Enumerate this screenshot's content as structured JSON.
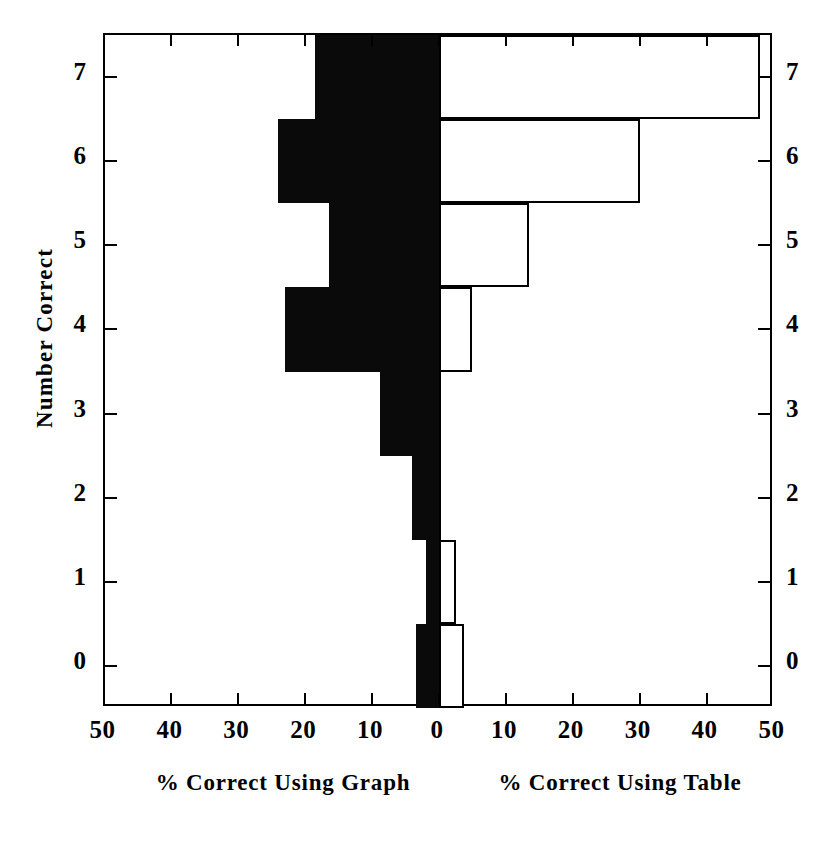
{
  "chart_data": {
    "type": "bar",
    "orientation": "horizontal",
    "subtype": "back-to-back bidirectional histogram",
    "title": "",
    "ylabel": "Number Correct",
    "xlabel": "",
    "categories": [
      "0",
      "1",
      "2",
      "3",
      "4",
      "5",
      "6",
      "7"
    ],
    "y_tick_labels": [
      "0",
      "1",
      "2",
      "3",
      "4",
      "5",
      "6",
      "7"
    ],
    "x_tick_labels_left": [
      "50",
      "40",
      "30",
      "20",
      "10",
      "0"
    ],
    "x_tick_labels_right": [
      "0",
      "10",
      "20",
      "30",
      "40",
      "50"
    ],
    "x_tick_values": [
      50,
      40,
      30,
      20,
      10,
      0,
      10,
      20,
      30,
      40,
      50
    ],
    "xlim": [
      -50,
      50
    ],
    "ylim": [
      -0.5,
      7.5
    ],
    "grid": false,
    "legend_position": "none",
    "series": [
      {
        "name": "% Correct Using Graph",
        "axis_title": "% Correct Using Graph",
        "side": "left",
        "fill": "#0a0a0a",
        "values": [
          3.5,
          2.0,
          4.0,
          8.8,
          23.0,
          16.4,
          24.0,
          18.5
        ]
      },
      {
        "name": "% Correct Using Table",
        "axis_title": "% Correct Using Table",
        "side": "right",
        "fill": "#ffffff",
        "stroke": "#000000",
        "values": [
          3.7,
          2.5,
          0.0,
          0.0,
          5.0,
          13.4,
          30.0,
          48.0
        ]
      }
    ]
  },
  "axis_titles": {
    "y": "Number Correct",
    "x_left": "% Correct Using Graph",
    "x_right": "% Correct Using Table"
  },
  "colors": {
    "graph_bar": "#0a0a0a",
    "table_bar": "#ffffff",
    "axis": "#000000",
    "background": "#ffffff"
  }
}
